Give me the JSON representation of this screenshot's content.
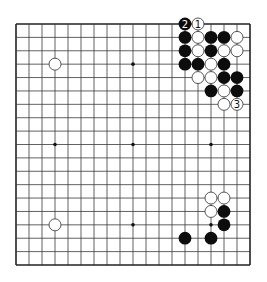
{
  "diagram": {
    "type": "go-board",
    "size": 19,
    "colors": {
      "background": "#ffffff",
      "grid": "#3a3a3a",
      "border": "#222222",
      "black_stone": "#0d0d0d",
      "white_stone": "#ffffff",
      "white_stone_outline": "#444444",
      "star_point": "#111111"
    },
    "star_points": [
      [
        4,
        4
      ],
      [
        10,
        4
      ],
      [
        16,
        4
      ],
      [
        4,
        10
      ],
      [
        10,
        10
      ],
      [
        16,
        10
      ],
      [
        4,
        16
      ],
      [
        10,
        16
      ],
      [
        16,
        16
      ]
    ],
    "stones": [
      {
        "col": 14,
        "row": 1,
        "color": "black",
        "label": "2"
      },
      {
        "col": 15,
        "row": 1,
        "color": "white",
        "label": "1"
      },
      {
        "col": 14,
        "row": 2,
        "color": "black"
      },
      {
        "col": 15,
        "row": 2,
        "color": "white"
      },
      {
        "col": 16,
        "row": 2,
        "color": "black"
      },
      {
        "col": 17,
        "row": 2,
        "color": "black"
      },
      {
        "col": 18,
        "row": 2,
        "color": "white"
      },
      {
        "col": 14,
        "row": 3,
        "color": "black"
      },
      {
        "col": 15,
        "row": 3,
        "color": "white"
      },
      {
        "col": 16,
        "row": 3,
        "color": "black"
      },
      {
        "col": 17,
        "row": 3,
        "color": "white"
      },
      {
        "col": 18,
        "row": 3,
        "color": "white"
      },
      {
        "col": 14,
        "row": 4,
        "color": "black"
      },
      {
        "col": 15,
        "row": 4,
        "color": "black"
      },
      {
        "col": 16,
        "row": 4,
        "color": "white"
      },
      {
        "col": 17,
        "row": 4,
        "color": "black"
      },
      {
        "col": 15,
        "row": 5,
        "color": "white"
      },
      {
        "col": 16,
        "row": 5,
        "color": "white"
      },
      {
        "col": 17,
        "row": 5,
        "color": "black"
      },
      {
        "col": 18,
        "row": 5,
        "color": "black"
      },
      {
        "col": 16,
        "row": 6,
        "color": "black"
      },
      {
        "col": 17,
        "row": 6,
        "color": "white"
      },
      {
        "col": 18,
        "row": 6,
        "color": "black"
      },
      {
        "col": 17,
        "row": 7,
        "color": "white"
      },
      {
        "col": 18,
        "row": 7,
        "color": "white",
        "label": "3"
      },
      {
        "col": 4,
        "row": 4,
        "color": "white"
      },
      {
        "col": 4,
        "row": 16,
        "color": "white"
      },
      {
        "col": 16,
        "row": 14,
        "color": "white"
      },
      {
        "col": 17,
        "row": 14,
        "color": "white"
      },
      {
        "col": 16,
        "row": 15,
        "color": "white"
      },
      {
        "col": 17,
        "row": 15,
        "color": "black"
      },
      {
        "col": 17,
        "row": 16,
        "color": "black"
      },
      {
        "col": 14,
        "row": 17,
        "color": "black"
      },
      {
        "col": 16,
        "row": 17,
        "color": "black"
      }
    ],
    "move_labels": [
      "1",
      "2",
      "3"
    ]
  }
}
